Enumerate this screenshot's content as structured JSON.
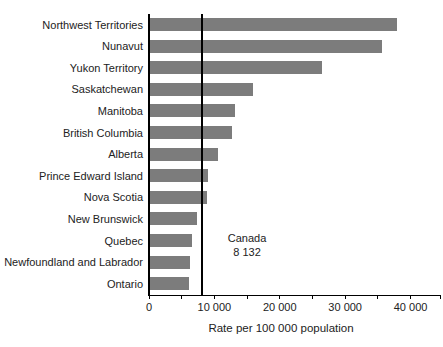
{
  "chart_data": {
    "type": "bar",
    "orientation": "horizontal",
    "title": "",
    "xlabel": "Rate per 100 000 population",
    "categories": [
      "Northwest Territories",
      "Nunavut",
      "Yukon Territory",
      "Saskatchewan",
      "Manitoba",
      "British Columbia",
      "Alberta",
      "Prince Edward Island",
      "Nova Scotia",
      "New Brunswick",
      "Quebec",
      "Newfoundland and Labrador",
      "Ontario"
    ],
    "values": [
      37900,
      35600,
      26500,
      15900,
      13100,
      12700,
      10500,
      9000,
      8800,
      7300,
      6500,
      6300,
      6100
    ],
    "xlim": [
      0,
      44500
    ],
    "xticks": [
      {
        "value": 0,
        "label": "0"
      },
      {
        "value": 10000,
        "label": "10 000"
      },
      {
        "value": 20000,
        "label": "20 000"
      },
      {
        "value": 30000,
        "label": "30 000"
      },
      {
        "value": 40000,
        "label": "40 000"
      }
    ],
    "minor_tick_values": [
      0,
      5000,
      10000,
      15000,
      20000,
      25000,
      30000,
      35000,
      40000,
      44500
    ],
    "reference_line": {
      "value": 8132,
      "label": "Canada",
      "value_label": "8 132"
    },
    "bar_color": "#7c7c7c",
    "axis_color": "#000000",
    "text_color": "#222222",
    "grid": false,
    "legend": null
  }
}
